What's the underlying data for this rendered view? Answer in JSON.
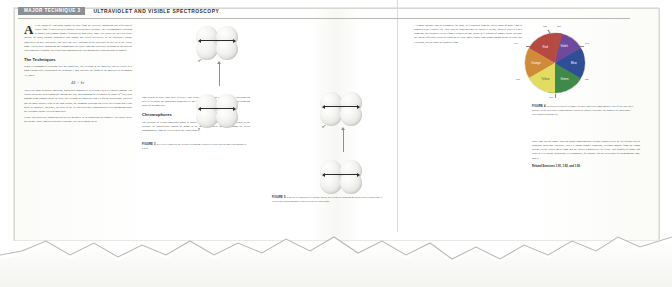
{
  "header": {
    "tag": "MAJOR TECHNIQUE 3",
    "title": "ULTRAVIOLET AND VISIBLE SPECTROSCOPY"
  },
  "columns": {
    "col1": {
      "dropcap": "A",
      "para1": "ll the colors of vegetation around us arise from the selective absorption and reflection of visible light. If our eyes were sensitive to ultraviolet radiation—the electromagnetic radiation at shorter wavelengths (higher frequencies) than violet light—we would see an even richer tapestry of color, because substances also absorb and reflect selectively in the ultraviolet region. Honeybees do have this ability, and they can \"see\" radiation in the ultraviolet as well as in the visible range. The selective absorption and transmittance of visible light and ultraviolet radiation are the basis of a spectroscopic technique for identifying compounds and determining their concentration in samples.",
      "heading1": "The Techniques",
      "para2": "When electromagnetic radiation falls on a molecule, the electrons in the molecule can be excited to a higher energy state. Radiation of the frequency ν (nu) can raise the energy of the molecule by an amount ΔE, where",
      "equation": "ΔE = hν",
      "para3": "This is the Bohr frequency condition, which was encountered in Section 1.4; h is Planck's constant. For typical ultraviolet wavelengths (of 100 nm and less, corresponding to a frequency of about 10¹⁵ Hz), such photons bring enough energy to excite the electrons in a molecule into a different distribution. Provided that an empty orbital exists at the right energy, the incoming radiation can excite an electron into it and hence be absorbed. Therefore, the study of the life and ultraviolet absorption gives us information about the electronic energy levels of molecules.",
      "para4": "Visible and ultraviolet absorption spectra are measured in an absorption spectrometer. The source gives out intense visible light or ultraviolet radiation. The wavelengths can be"
    },
    "col2": {
      "para1": "light present in white light to be reflected. That is why most vegetation looks green. The spectrum can help us to assess the absorption quantitatively and to relate a precise analysis of the energy-capturing power of the molecule.",
      "heading1": "Chromophores",
      "para2": "The presence of certain absorption bands in visible and ultraviolet spectra can often be traced to the presence of characteristic groups of atoms in the molecules. These groups of atoms are called chromophores, from the Greek words for \"color bringer.\""
    },
    "col3": {
      "para1": "A d-metal ion may also be responsible for color, as is apparent from the varied colors of many d-metal complexes (see Chapter 16). Two types of transitions may be involved. In one, which is called a d-to-d transition, an electron is excited from a d-orbital of one energy to a d-orbital of higher energy. Because the energy differences between d-orbitals are quite small, visible light brings enough energy to cause this excitation, and so colors are absorbed from"
    },
    "col4": {
      "para1": "white light and the sample takes on colors complementary to those absorbed (Fig. 4). In a second type of transition involving d-orbitals, called a charge-transfer transition, electrons migrate from the atoms attached to the central metal atom into the latter's d-orbitals or vice versa. This transfer of charge can result in very intense absorption; it is responsible, for instance, for the deep purple of permanganate ions, MnO₄⁻.",
      "related": "Related Exercises 1.91, 1.92, and 1.93"
    }
  },
  "figures": {
    "fig3": {
      "label": "FIGURE 3",
      "caption": "In a π-to-π* transition, an electron in a bonding π-orbital is excited into an empty antibonding π* orbital.",
      "upper_orbital": "π*",
      "lower_orbital": "π"
    },
    "fig5": {
      "label": "FIGURE 5",
      "caption": "In an n-to-π* transition of a carbonyl group, an electron in a nonbonding orbital on the oxygen atom is excited into an antibonding π* orbital spread over both atoms.",
      "orbital_label": "π*"
    },
    "fig4": {
      "label": "FIGURE 4",
      "caption": "The perceived color of a complex in white light is the complementary color of the light that it absorbs. In this color wheel, complementary colors are opposite each other. The numbers are approximate wavelengths in nanometers."
    }
  },
  "color_wheel": {
    "segments": [
      {
        "name": "Violet",
        "color": "#6d4a9c",
        "start_deg": 0
      },
      {
        "name": "Blue",
        "color": "#2e4f96",
        "start_deg": 60
      },
      {
        "name": "Green",
        "color": "#3f8a4a",
        "start_deg": 120
      },
      {
        "name": "Yellow",
        "color": "#e6d84f",
        "start_deg": 180
      },
      {
        "name": "Orange",
        "color": "#d98529",
        "start_deg": 240
      },
      {
        "name": "Red",
        "color": "#b8332f",
        "start_deg": 300
      }
    ],
    "wavelengths": [
      "400",
      "430",
      "490",
      "560",
      "580",
      "620",
      "800"
    ],
    "labels": {
      "top_left": "800",
      "top_right": "400",
      "upper_right": "430",
      "left": "620",
      "lower_left": "580",
      "lower_right": "490",
      "bottom": "560"
    }
  }
}
